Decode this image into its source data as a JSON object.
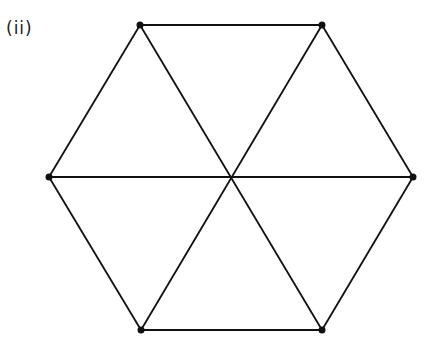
{
  "figure": {
    "label": "(ii)",
    "line_color": "#111111",
    "vertices": [
      {
        "id": "top-left",
        "x": 140,
        "y": 25,
        "dot": true
      },
      {
        "id": "top-right",
        "x": 322,
        "y": 25,
        "dot": true
      },
      {
        "id": "right",
        "x": 413,
        "y": 177,
        "dot": true
      },
      {
        "id": "bottom-right",
        "x": 322,
        "y": 330,
        "dot": true
      },
      {
        "id": "bottom-left",
        "x": 141,
        "y": 330,
        "dot": true
      },
      {
        "id": "left",
        "x": 49,
        "y": 177,
        "dot": true
      },
      {
        "id": "center",
        "x": 231,
        "y": 177,
        "dot": false
      }
    ],
    "edges": [
      [
        "top-left",
        "top-right"
      ],
      [
        "top-right",
        "right"
      ],
      [
        "right",
        "bottom-right"
      ],
      [
        "bottom-right",
        "bottom-left"
      ],
      [
        "bottom-left",
        "left"
      ],
      [
        "left",
        "top-left"
      ],
      [
        "top-left",
        "bottom-right"
      ],
      [
        "top-right",
        "bottom-left"
      ],
      [
        "left",
        "right"
      ]
    ]
  }
}
